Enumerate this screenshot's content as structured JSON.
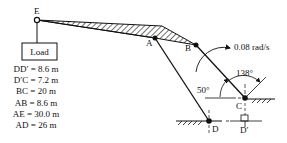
{
  "diagram": {
    "type": "linkage mechanism",
    "points": {
      "E": "E",
      "A": "A",
      "B": "B",
      "C": "C",
      "D": "D",
      "D_prime": "D′"
    },
    "load_label": "Load",
    "angular_velocity": "0.08 rad/s",
    "angle_1": "50°",
    "angle_2": "138°",
    "dimensions": [
      "DD′ = 8.6 m",
      "D′C = 7.2 m",
      "BC = 20 m",
      "AB = 8.6 m",
      "AE = 30.0 m",
      "AD = 26 m"
    ],
    "colors": {
      "line": "#111111",
      "background": "#ffffff"
    }
  }
}
